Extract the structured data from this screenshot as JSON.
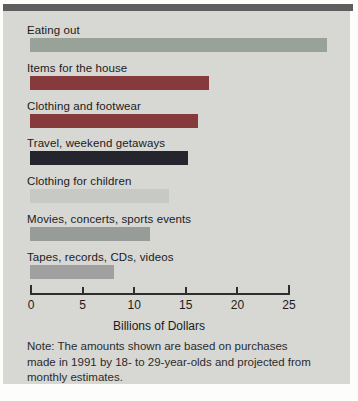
{
  "chart_data": {
    "type": "bar",
    "orientation": "horizontal",
    "categories": [
      "Eating out",
      "Items for the house",
      "Clothing and footwear",
      "Travel, weekend getaways",
      "Clothing for children",
      "Movies, concerts, sports events",
      "Tapes, records, CDs, videos"
    ],
    "values": [
      28.8,
      17.3,
      16.3,
      15.3,
      13.5,
      11.6,
      8.1
    ],
    "bar_colors": [
      "#99a299",
      "#873a3c",
      "#873a3c",
      "#25262d",
      "#c7c9c5",
      "#989c98",
      "#9fa09f"
    ],
    "title": "",
    "xlabel": "Billions of Dollars",
    "ylabel": "",
    "xlim": [
      0,
      25
    ],
    "x_ticks": [
      0,
      5,
      10,
      15,
      20,
      25
    ],
    "grid": false,
    "legend": "none",
    "note": "Note: The amounts shown are based on purchases made in 1991 by 18- to 29-year-olds and projected from monthly estimates."
  },
  "colors": {
    "panel_background": "#d7d7d4",
    "top_strip": "#5e5e5e",
    "axis": "#2e2e2e",
    "text": "#1b1b1b"
  }
}
